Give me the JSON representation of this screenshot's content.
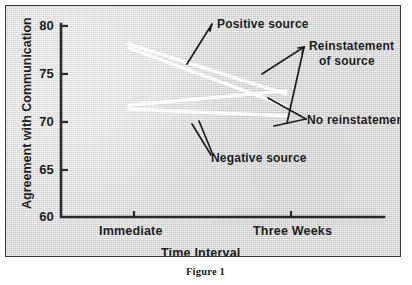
{
  "figure": {
    "caption": "Figure 1"
  },
  "chart_data": {
    "type": "line",
    "title": "",
    "xlabel": "Time Interval",
    "ylabel": "Agreement with Communication",
    "x": [
      "Immediate",
      "Three Weeks"
    ],
    "xtick_labels": [
      "Immediate",
      "Three Weeks"
    ],
    "ytick_labels": [
      "60",
      "65",
      "70",
      "75",
      "80"
    ],
    "yticks": [
      60,
      65,
      70,
      75,
      80
    ],
    "ylim": [
      60,
      80
    ],
    "grid": false,
    "legend": "annotations",
    "line_color": "#ffffff",
    "axis_color": "#2b2b2b",
    "series": [
      {
        "name": "Positive source, Reinstatement of source",
        "values": [
          78.1,
          72.9
        ]
      },
      {
        "name": "Positive source, No reinstatement",
        "values": [
          77.7,
          71.6
        ]
      },
      {
        "name": "Negative source, No reinstatement",
        "values": [
          71.7,
          73.2
        ]
      },
      {
        "name": "Negative source, Reinstatement of source",
        "values": [
          71.3,
          70.6
        ]
      }
    ],
    "annotations": [
      {
        "text": "Positive  source",
        "x": 216,
        "y": 16
      },
      {
        "text": "Reinstatement",
        "x": 311,
        "y": 39
      },
      {
        "text": "of source",
        "x": 320,
        "y": 54
      },
      {
        "text": "No reinstatement",
        "x": 306,
        "y": 116
      },
      {
        "text": "Negative source",
        "x": 210,
        "y": 152
      }
    ]
  }
}
